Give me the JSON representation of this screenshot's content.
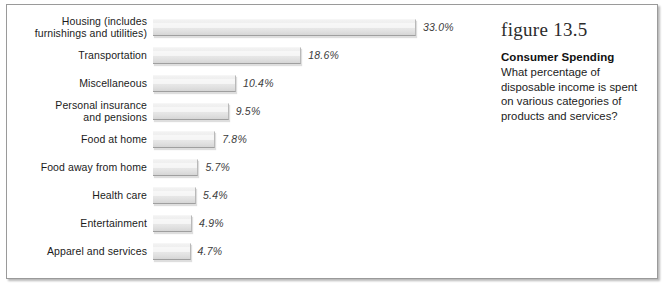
{
  "chart_data": {
    "type": "bar",
    "orientation": "horizontal",
    "title": "Consumer Spending",
    "xlabel": "",
    "ylabel": "",
    "xlim": [
      0,
      33
    ],
    "grid": false,
    "legend": false,
    "categories": [
      "Housing (includes\nfurnishings and utilities)",
      "Transportation",
      "Miscellaneous",
      "Personal insurance\nand pensions",
      "Food at home",
      "Food away from home",
      "Health care",
      "Entertainment",
      "Apparel and services"
    ],
    "values": [
      33.0,
      18.6,
      10.4,
      9.5,
      7.8,
      5.7,
      5.4,
      4.9,
      4.7
    ],
    "value_labels": [
      "33.0%",
      "18.6%",
      "10.4%",
      "9.5%",
      "7.8%",
      "5.7%",
      "5.4%",
      "4.9%",
      "4.7%"
    ],
    "bar_color": "#e8e8e8",
    "bar_edge_color": "#9f9f9f"
  },
  "caption": {
    "figure_number": "figure 13.5",
    "title": "Consumer Spending",
    "description": "What percentage of disposable income is spent on various categories of products and services?"
  },
  "style": {
    "border_color": "#9a9a9a",
    "text_color": "#1b1b1b",
    "value_text_color": "#3c3c3c"
  }
}
